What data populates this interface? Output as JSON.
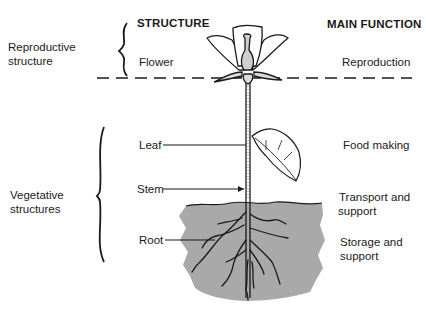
{
  "headers": {
    "structure": "STRUCTURE",
    "main_function": "MAIN FUNCTION"
  },
  "groups": {
    "reproductive": "Reproductive\nstructure",
    "reproductive_line1": "Reproductive",
    "reproductive_line2": "structure",
    "vegetative_line1": "Vegetative",
    "vegetative_line2": "structures"
  },
  "parts": [
    {
      "structure": "Flower",
      "function_line1": "Reproduction",
      "function_line2": ""
    },
    {
      "structure": "Leaf",
      "function_line1": "Food making",
      "function_line2": ""
    },
    {
      "structure": "Stem",
      "function_line1": "Transport and",
      "function_line2": "support"
    },
    {
      "structure": "Root",
      "function_line1": "Storage and",
      "function_line2": "support"
    }
  ],
  "colors": {
    "ink": "#1a1a1a",
    "soil": "#a9a9a9",
    "background": "#ffffff"
  }
}
